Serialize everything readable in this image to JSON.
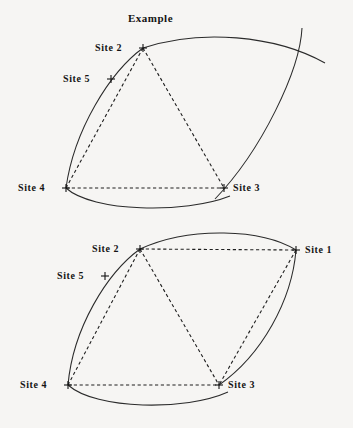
{
  "figure": {
    "title": "Example",
    "background_color": "#f6f5f3",
    "ink_color": "#1f1f1f",
    "width": 353,
    "height": 428
  },
  "title_pos": {
    "x": 128,
    "y": 13
  },
  "panels": [
    {
      "id": "top-panel",
      "name": "example-diagram-top",
      "note": "Lens formed by two circular arcs; Site 1 lies outside the image frame to the upper right so the right arc is clipped by the frame edge.",
      "sites": [
        {
          "id": "site-2",
          "label": "Site 2",
          "x": 143,
          "y": 48,
          "label_x": 95,
          "label_y": 43
        },
        {
          "id": "site-5",
          "label": "Site 5",
          "x": 111,
          "y": 79,
          "label_x": 63,
          "label_y": 74
        },
        {
          "id": "site-4",
          "label": "Site 4",
          "x": 66,
          "y": 188,
          "label_x": 18,
          "label_y": 183
        },
        {
          "id": "site-3",
          "label": "Site 3",
          "x": 224,
          "y": 188,
          "label_x": 233,
          "label_y": 183
        }
      ],
      "arcs": [
        {
          "id": "arc-left-outer",
          "d": "M 143 48 C 110 72, 74 130, 66 188"
        },
        {
          "id": "arc-bottom",
          "d": "M 66 188 C 92 212, 185 214, 230 196"
        },
        {
          "id": "arc-right-upper",
          "d": "M 143 48 C 200 29, 275 35, 325 63"
        },
        {
          "id": "arc-right-lower",
          "d": "M 302 28 C 300 70, 262 150, 215 199"
        }
      ],
      "chords": [
        {
          "id": "chord-2-4",
          "x1": 143,
          "y1": 48,
          "x2": 66,
          "y2": 188
        },
        {
          "id": "chord-2-3",
          "x1": 143,
          "y1": 48,
          "x2": 224,
          "y2": 188
        },
        {
          "id": "chord-4-3",
          "x1": 66,
          "y1": 188,
          "x2": 224,
          "y2": 188
        }
      ]
    },
    {
      "id": "bottom-panel",
      "name": "example-diagram-bottom",
      "note": "Same lens with Site 1 visible at the right vertex; chords connect sites 2-1, 2-4, 2-3, 4-3, 1-3.",
      "sites": [
        {
          "id": "site-2",
          "label": "Site 2",
          "x": 140,
          "y": 249,
          "label_x": 92,
          "label_y": 244
        },
        {
          "id": "site-1",
          "label": "Site 1",
          "x": 296,
          "y": 250,
          "label_x": 305,
          "label_y": 245
        },
        {
          "id": "site-5",
          "label": "Site 5",
          "x": 105,
          "y": 276,
          "label_x": 57,
          "label_y": 271
        },
        {
          "id": "site-4",
          "label": "Site 4",
          "x": 68,
          "y": 385,
          "label_x": 20,
          "label_y": 380
        },
        {
          "id": "site-3",
          "label": "Site 3",
          "x": 219,
          "y": 385,
          "label_x": 228,
          "label_y": 380
        }
      ],
      "arcs": [
        {
          "id": "arc-left-outer",
          "d": "M 140 249 C 107 273, 73 328, 68 385"
        },
        {
          "id": "arc-bottom",
          "d": "M 68 385 C 96 410, 186 411, 228 392"
        },
        {
          "id": "arc-top-right",
          "d": "M 140 249 C 190 226, 262 229, 296 250"
        },
        {
          "id": "arc-right-lower",
          "d": "M 296 250 C 292 300, 262 355, 219 385"
        }
      ],
      "chords": [
        {
          "id": "chord-2-1",
          "x1": 140,
          "y1": 249,
          "x2": 296,
          "y2": 250
        },
        {
          "id": "chord-2-4",
          "x1": 140,
          "y1": 249,
          "x2": 68,
          "y2": 385
        },
        {
          "id": "chord-2-3",
          "x1": 140,
          "y1": 249,
          "x2": 219,
          "y2": 385
        },
        {
          "id": "chord-4-3",
          "x1": 68,
          "y1": 385,
          "x2": 219,
          "y2": 385
        },
        {
          "id": "chord-1-3",
          "x1": 296,
          "y1": 250,
          "x2": 219,
          "y2": 385
        }
      ]
    }
  ]
}
